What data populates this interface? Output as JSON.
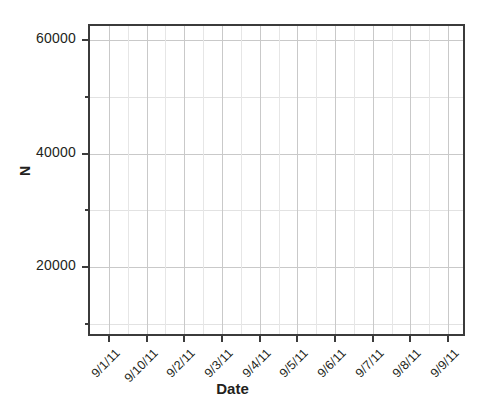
{
  "chart_data": {
    "type": "line",
    "title": "",
    "subtitle": "",
    "xlabel": "Date",
    "ylabel": "N",
    "grid": true,
    "legend": null,
    "series": [],
    "note": "Empty plot frame: axes, gridlines and tick labels are drawn but no data is rendered inside the plotting region.",
    "x": {
      "type": "category",
      "categories": [
        "9/1/11",
        "9/10/11",
        "9/2/11",
        "9/3/11",
        "9/4/11",
        "9/5/11",
        "9/6/11",
        "9/7/11",
        "9/8/11",
        "9/9/11"
      ],
      "tick_rotation_degrees": -45,
      "minor_gridlines_between_ticks": 1
    },
    "y": {
      "type": "linear",
      "ylim": [
        7500,
        62500
      ],
      "major_ticks": [
        20000,
        40000,
        60000
      ],
      "major_tick_labels": [
        "20000",
        "40000",
        "60000"
      ],
      "minor_ticks": [
        10000,
        30000,
        50000
      ]
    },
    "values": []
  },
  "style": {
    "background": "#ffffff",
    "axis_color": "#3b3b3b",
    "major_grid_color": "#c9c9c9",
    "minor_grid_color": "#e4e4e4",
    "text_color": "#231f20"
  }
}
